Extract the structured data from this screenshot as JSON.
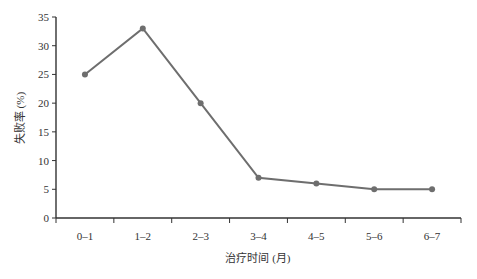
{
  "chart_data": {
    "type": "line",
    "title": "",
    "xlabel": "治疗时间 (月)",
    "ylabel": "失败率 (%)",
    "categories": [
      "0–1",
      "1–2",
      "2–3",
      "3–4",
      "4–5",
      "5–6",
      "6–7"
    ],
    "series": [
      {
        "name": "失败率",
        "values": [
          25,
          33,
          20,
          7,
          6,
          5,
          5
        ]
      }
    ],
    "ylim": [
      0,
      35
    ],
    "yticks": [
      0,
      5,
      10,
      15,
      20,
      25,
      30,
      35
    ],
    "grid": false,
    "legend": "none",
    "colors": {
      "line": "#6e6e6e",
      "marker": "#6e6e6e",
      "axis": "#333333"
    }
  }
}
